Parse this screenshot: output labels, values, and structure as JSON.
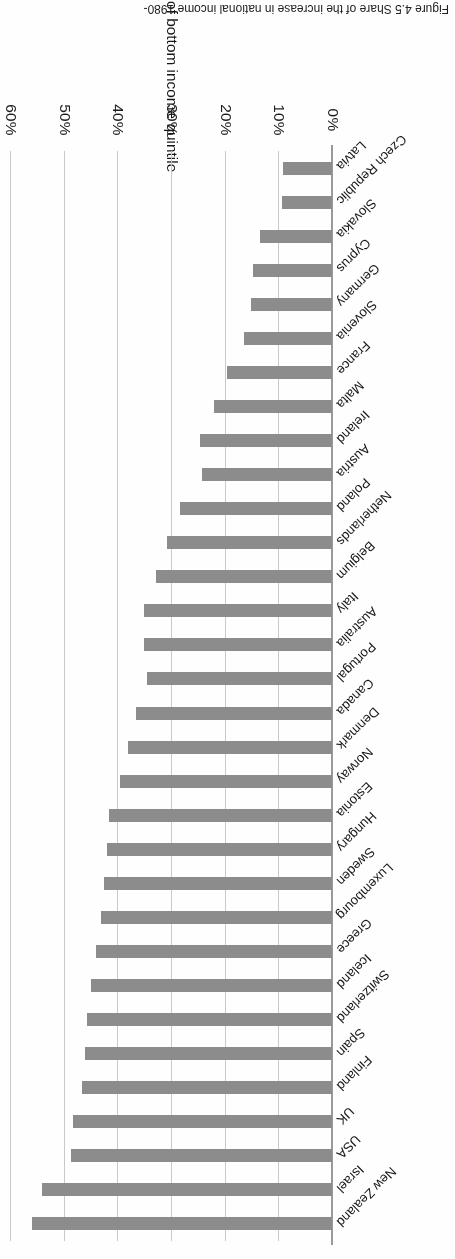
{
  "figure": {
    "caption": "Figure 4.5  Share of the increase in national income 1980-",
    "rotation_note": "180"
  },
  "axis": {
    "y_axis_title": "Share of bottom income quintile",
    "x_tick_labels": [
      "0%",
      "10%",
      "20%",
      "30%",
      "40%",
      "50%",
      "60%"
    ],
    "x_tick_values": [
      0,
      10,
      20,
      30,
      40,
      50,
      60
    ]
  },
  "style": {
    "bar_color": "#8c8c8c",
    "gridline_color": "#c9c9c9",
    "background": "#fefefe"
  },
  "chart_data": {
    "type": "bar",
    "title": "",
    "xlabel": "",
    "ylabel": "Share of bottom income quintile",
    "ylim": [
      0,
      60
    ],
    "orientation": "horizontal",
    "grid": true,
    "legend": "none",
    "categories": [
      "New Zealand",
      "Israel",
      "USA",
      "UK",
      "Finland",
      "Spain",
      "Switzerland",
      "Iceland",
      "Greece",
      "Luxembourg",
      "Sweden",
      "Hungary",
      "Estonia",
      "Norway",
      "Denmark",
      "Canada",
      "Portugal",
      "Australia",
      "Italy",
      "Belgium",
      "Netherlands",
      "Poland",
      "Austria",
      "Ireland",
      "Malta",
      "France",
      "Slovenia",
      "Germany",
      "Cyprus",
      "Slovakia",
      "Czech Republic",
      "Latvia"
    ],
    "values": [
      55.9,
      54.0,
      48.6,
      48.3,
      46.5,
      46.0,
      45.6,
      44.9,
      44.0,
      43.0,
      42.4,
      42.0,
      41.5,
      39.5,
      38.0,
      36.5,
      34.5,
      35.0,
      35.0,
      32.8,
      30.7,
      28.3,
      24.2,
      24.6,
      22.0,
      19.6,
      16.4,
      15.1,
      14.7,
      13.4,
      9.3,
      9.1
    ]
  }
}
